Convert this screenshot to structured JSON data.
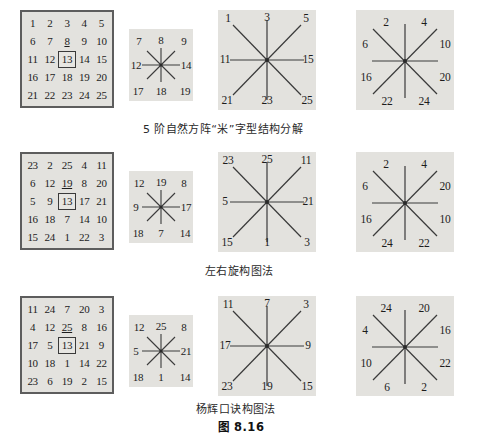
{
  "figure": {
    "label": "图 8.16",
    "rows": [
      {
        "id": "row-natural",
        "caption": "5 阶自然方阵“米”字型结构分解",
        "square": {
          "highlight_value": "13",
          "underlined": [
            "8"
          ],
          "rows": [
            [
              "1",
              "2",
              "3",
              "4",
              "5"
            ],
            [
              "6",
              "7",
              "8",
              "9",
              "10"
            ],
            [
              "11",
              "12",
              "13",
              "14",
              "15"
            ],
            [
              "16",
              "17",
              "18",
              "19",
              "20"
            ],
            [
              "21",
              "22",
              "23",
              "24",
              "25"
            ]
          ]
        },
        "star_small": {
          "nw": "7",
          "n": "8",
          "ne": "9",
          "w": "12",
          "e": "14",
          "sw": "17",
          "s": "18",
          "se": "19"
        },
        "star_mid": {
          "nw": "1",
          "n": "3",
          "ne": "5",
          "w": "11",
          "e": "15",
          "sw": "21",
          "s": "23",
          "se": "25"
        },
        "star_right": {
          "nw": "2",
          "ne": "4",
          "w": "6",
          "e": "10",
          "sw": "16",
          "se": "20",
          "s_left": "22",
          "s_right": "24"
        }
      },
      {
        "id": "row-rotate",
        "caption": "左右旋构图法",
        "square": {
          "highlight_value": "13",
          "underlined": [
            "19"
          ],
          "rows": [
            [
              "23",
              "2",
              "25",
              "4",
              "11"
            ],
            [
              "6",
              "12",
              "19",
              "8",
              "20"
            ],
            [
              "5",
              "9",
              "13",
              "17",
              "21"
            ],
            [
              "16",
              "18",
              "7",
              "14",
              "10"
            ],
            [
              "15",
              "24",
              "1",
              "22",
              "3"
            ]
          ]
        },
        "star_small": {
          "nw": "12",
          "n": "19",
          "ne": "8",
          "w": "9",
          "e": "17",
          "sw": "18",
          "s": "7",
          "se": "14"
        },
        "star_mid": {
          "nw": "23",
          "n": "25",
          "ne": "11",
          "w": "5",
          "e": "21",
          "sw": "15",
          "s": "1",
          "se": "3"
        },
        "star_right": {
          "nw": "2",
          "ne": "4",
          "w": "6",
          "e": "20",
          "sw": "16",
          "se": "10",
          "s_left": "24",
          "s_right": "22"
        }
      },
      {
        "id": "row-yanghui",
        "caption": "杨辉口诀构图法",
        "square": {
          "highlight_value": "13",
          "underlined": [
            "25"
          ],
          "rows": [
            [
              "11",
              "24",
              "7",
              "20",
              "3"
            ],
            [
              "4",
              "12",
              "25",
              "8",
              "16"
            ],
            [
              "17",
              "5",
              "13",
              "21",
              "9"
            ],
            [
              "10",
              "18",
              "1",
              "14",
              "22"
            ],
            [
              "23",
              "6",
              "19",
              "2",
              "15"
            ]
          ]
        },
        "star_small": {
          "nw": "12",
          "n": "25",
          "ne": "8",
          "w": "5",
          "e": "21",
          "sw": "18",
          "s": "1",
          "se": "14"
        },
        "star_mid": {
          "nw": "11",
          "n": "7",
          "ne": "3",
          "w": "17",
          "e": "9",
          "sw": "23",
          "s": "19",
          "se": "15"
        },
        "star_right": {
          "nw": "24",
          "ne": "20",
          "w": "4",
          "e": "16",
          "sw": "10",
          "se": "22",
          "s_left": "6",
          "s_right": "2"
        }
      }
    ]
  },
  "colors": {
    "panel_bg": "#e3e2de",
    "grid_border": "#5d5d5d",
    "line": "#3a3a3a",
    "text": "#1c1c1c"
  }
}
